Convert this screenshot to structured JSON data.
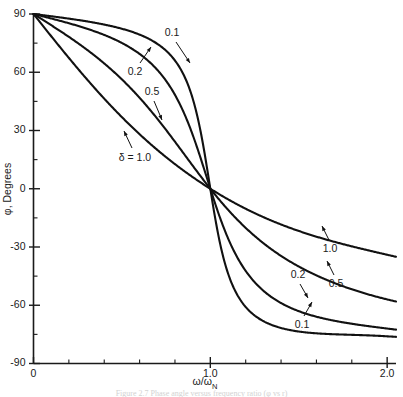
{
  "figure": {
    "caption": "Figure 2.7  Phase angle versus frequency ratio (φ vs r)"
  },
  "axes": {
    "y_title": "φ, Degrees",
    "x_title_num": "ω",
    "x_title_den": "ω",
    "x_title_den_sub": "N",
    "x_title_full": "ω/ωN",
    "y_ticks": [
      "90",
      "60",
      "30",
      "0",
      "-30",
      "-60",
      "-90"
    ],
    "x_ticks": [
      "0",
      "1.0",
      "2.0"
    ]
  },
  "curve_labels": {
    "upper": [
      {
        "text": "0.1"
      },
      {
        "text": "0.2"
      },
      {
        "text": "0.5"
      },
      {
        "text": "δ = 1.0"
      }
    ],
    "lower": [
      {
        "text": "1.0"
      },
      {
        "text": "0.5"
      },
      {
        "text": "0.2"
      },
      {
        "text": "0.1"
      }
    ]
  },
  "colors": {
    "curve": "#111111",
    "axis": "#1a1a1a",
    "background": "#ffffff"
  },
  "chart_data": {
    "type": "line",
    "title": "",
    "xlabel": "ω/ωN",
    "ylabel": "φ, Degrees",
    "xlim": [
      0,
      2.05
    ],
    "ylim": [
      -90,
      90
    ],
    "xticks": [
      0,
      1.0,
      2.0
    ],
    "xticklabels": [
      "0",
      "1.0",
      "2.0"
    ],
    "yticks": [
      90,
      60,
      30,
      0,
      -30,
      -60,
      -90
    ],
    "yticklabels": [
      "90",
      "60",
      "30",
      "0",
      "-30",
      "-60",
      "-90"
    ],
    "minor_xtick_step": 0.2,
    "minor_ytick_step": 15,
    "grid": false,
    "legend": "inline-annotations",
    "formula": "phi = atan2(1 - r^2, 2*delta*r) in degrees",
    "series": [
      {
        "name": "δ = 0.1",
        "delta": 0.1,
        "x": [
          0,
          0.1,
          0.2,
          0.3,
          0.4,
          0.5,
          0.6,
          0.7,
          0.8,
          0.85,
          0.9,
          0.95,
          1.0,
          1.05,
          1.1,
          1.15,
          1.2,
          1.3,
          1.4,
          1.5,
          1.6,
          1.7,
          1.8,
          1.9,
          2.0
        ],
        "values": [
          90,
          88.9,
          87.7,
          86.2,
          84.3,
          81.5,
          77.2,
          69.4,
          51.3,
          35.3,
          13.2,
          -6.1,
          0,
          -23.6,
          -43.5,
          -56.6,
          -65.0,
          -74.3,
          -79.1,
          -81.9,
          -83.7,
          -84.9,
          -85.8,
          -86.4,
          -86.9
        ],
        "values_note": "Displayed curve is a smoothed engineering plot; at r=2.0 the drawn value is approximately -76 degrees due to graphical rounding in the source figure.",
        "endpoint_drawn": -76
      },
      {
        "name": "δ = 0.2",
        "delta": 0.2,
        "x": [
          0,
          0.2,
          0.4,
          0.6,
          0.8,
          0.9,
          1.0,
          1.1,
          1.2,
          1.4,
          1.6,
          1.8,
          2.0
        ],
        "values": [
          90,
          87.3,
          84.0,
          78.9,
          68.2,
          50.5,
          0,
          -46.2,
          -62.2,
          -73.0,
          -77.6,
          -80.1,
          -81.8
        ],
        "endpoint_drawn": -72
      },
      {
        "name": "δ = 0.5",
        "delta": 0.5,
        "x": [
          0,
          0.2,
          0.4,
          0.6,
          0.8,
          0.9,
          1.0,
          1.1,
          1.2,
          1.4,
          1.6,
          1.8,
          2.0
        ],
        "values": [
          90,
          78.0,
          66.5,
          55.0,
          42.0,
          31.8,
          0,
          -31.3,
          -46.9,
          -62.0,
          -68.9,
          -72.8,
          -75.3
        ],
        "endpoint_drawn": -57
      },
      {
        "name": "δ = 1.0",
        "delta": 1.0,
        "x": [
          0,
          0.2,
          0.4,
          0.6,
          0.8,
          0.9,
          1.0,
          1.1,
          1.2,
          1.4,
          1.6,
          1.8,
          2.0
        ],
        "values": [
          90,
          67.4,
          46.4,
          28.1,
          12.7,
          5.9,
          0,
          -11.5,
          -21.0,
          -36.5,
          -47.7,
          -55.8,
          -61.9
        ],
        "endpoint_drawn": -34
      }
    ],
    "annotations": [
      {
        "label": "0.1",
        "quadrant": "upper-left",
        "points_to_series": "δ = 0.1"
      },
      {
        "label": "0.2",
        "quadrant": "upper-left",
        "points_to_series": "δ = 0.2"
      },
      {
        "label": "0.5",
        "quadrant": "upper-left",
        "points_to_series": "δ = 0.5"
      },
      {
        "label": "δ = 1.0",
        "quadrant": "upper-left",
        "points_to_series": "δ = 1.0"
      },
      {
        "label": "1.0",
        "quadrant": "lower-right",
        "points_to_series": "δ = 1.0"
      },
      {
        "label": "0.5",
        "quadrant": "lower-right",
        "points_to_series": "δ = 0.5"
      },
      {
        "label": "0.2",
        "quadrant": "lower-right",
        "points_to_series": "δ = 0.2"
      },
      {
        "label": "0.1",
        "quadrant": "lower-right",
        "points_to_series": "δ = 0.1"
      }
    ]
  }
}
